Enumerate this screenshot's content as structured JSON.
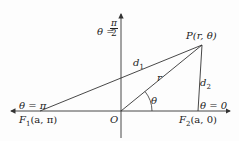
{
  "diagram": {
    "type": "polar-coordinate-geometry",
    "points": {
      "O": {
        "label": "O"
      },
      "P": {
        "label": "P(r, θ)"
      },
      "F1": {
        "label": "F",
        "sub": "1",
        "coords": "(a, π)"
      },
      "F2": {
        "label": "F",
        "sub": "2",
        "coords": "(a, 0)"
      }
    },
    "segments": {
      "d1": {
        "label": "d",
        "sub": "1"
      },
      "d2": {
        "label": "d",
        "sub": "2"
      },
      "r": {
        "label": "r"
      }
    },
    "angle": {
      "label": "θ"
    },
    "axis_labels": {
      "theta_pi_half": {
        "lhs": "θ =",
        "num": "π",
        "den": "2"
      },
      "theta_pi": "θ = π",
      "theta_zero": "θ = 0"
    },
    "colors": {
      "line": "#333333",
      "text": "#222222",
      "background": "#fdfdfd"
    }
  }
}
